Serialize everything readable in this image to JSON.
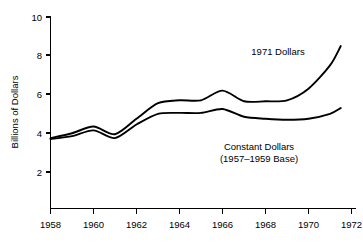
{
  "chart_data": {
    "type": "line",
    "title": "",
    "xlabel": "",
    "ylabel": "Billions of Dollars",
    "xlim": [
      1958,
      1972
    ],
    "ylim": [
      0,
      10
    ],
    "grid": false,
    "legend_position": "inline-annotations",
    "x_ticks": [
      "1958",
      "1960",
      "1962",
      "1964",
      "1966",
      "1968",
      "1970",
      "1972"
    ],
    "x_tick_values": [
      1958,
      1960,
      1962,
      1964,
      1966,
      1968,
      1970,
      1972
    ],
    "y_ticks": [
      "2",
      "4",
      "6",
      "8",
      "10"
    ],
    "y_tick_values": [
      2,
      4,
      6,
      8,
      10
    ],
    "x": [
      1958,
      1959,
      1960,
      1961,
      1962,
      1963,
      1964,
      1965,
      1966,
      1967,
      1968,
      1969,
      1970,
      1971,
      1971.5
    ],
    "series": [
      {
        "name": "1971 Dollars",
        "values": [
          3.75,
          4.0,
          4.35,
          3.95,
          4.75,
          5.55,
          5.7,
          5.7,
          6.2,
          5.65,
          5.65,
          5.7,
          6.3,
          7.5,
          8.5
        ]
      },
      {
        "name": "Constant Dollars (1957-1959 Base)",
        "values": [
          3.7,
          3.85,
          4.15,
          3.75,
          4.45,
          5.0,
          5.05,
          5.05,
          5.25,
          4.85,
          4.75,
          4.7,
          4.75,
          5.0,
          5.3
        ]
      }
    ],
    "annotations": [
      {
        "id": "upper-series-label",
        "text": "1971 Dollars",
        "x_px": 278,
        "y_px": 55
      },
      {
        "id": "lower-series-label-line1",
        "text": "Constant Dollars",
        "x_px": 259,
        "y_px": 150
      },
      {
        "id": "lower-series-label-line2",
        "text": "(1957–1959 Base)",
        "x_px": 259,
        "y_px": 162
      }
    ],
    "colors": {
      "line": "#000000",
      "axis": "#000000",
      "background": "#ffffff",
      "text": "#000000"
    }
  }
}
